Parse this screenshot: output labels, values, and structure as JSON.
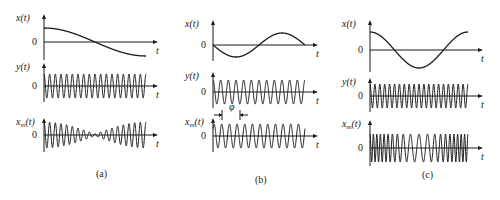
{
  "figure": {
    "colors": {
      "ink": "#1a1a1a",
      "background": "#ffffff"
    },
    "panels": [
      {
        "id": "a",
        "caption": "(a)",
        "caption_pos": [
          96,
          177
        ],
        "axis_x": 44,
        "x_end": 158,
        "wave_end": 146,
        "plots": [
          {
            "name": "x-plot",
            "label": "x(t)",
            "zero_label": "0",
            "t_label": "t",
            "top": 14,
            "zero_y": 42,
            "kind": "cos",
            "amp": 14,
            "cycles": 0.5,
            "start_phase": 0
          },
          {
            "name": "y-plot",
            "label": "y(t)",
            "zero_label": "0",
            "t_label": "t",
            "top": 63,
            "zero_y": 86,
            "kind": "carrier",
            "amp": 12,
            "cycles": 18
          },
          {
            "name": "xm-plot",
            "label": "x_m(t)",
            "zero_label": "0",
            "t_label": "t",
            "top": 118,
            "zero_y": 135,
            "kind": "am",
            "amp": 13,
            "cycles": 18
          }
        ]
      },
      {
        "id": "b",
        "caption": "(b)",
        "caption_pos": [
          255,
          183
        ],
        "axis_x": 213,
        "x_end": 318,
        "wave_end": 305,
        "phase_marker": {
          "label": "φ",
          "x1": 222,
          "x2": 240,
          "y": 115,
          "label_x": 231,
          "label_y": 110
        },
        "plots": [
          {
            "name": "x-plot",
            "label": "x(t)",
            "zero_label": "0",
            "t_label": "t",
            "top": 20,
            "zero_y": 45,
            "kind": "negsin",
            "amp": 12,
            "cycles": 1
          },
          {
            "name": "y-plot",
            "label": "y(t)",
            "zero_label": "0",
            "t_label": "t",
            "top": 72,
            "zero_y": 92,
            "kind": "carrier",
            "amp": 12,
            "cycles": 12
          },
          {
            "name": "xm-plot",
            "label": "x_m(t)",
            "zero_label": "0",
            "t_label": "t",
            "top": 118,
            "zero_y": 136,
            "kind": "pm",
            "amp": 12,
            "cycles": 12
          }
        ]
      },
      {
        "id": "c",
        "caption": "(c)",
        "caption_pos": [
          422,
          178
        ],
        "axis_x": 370,
        "x_end": 483,
        "wave_end": 468,
        "plots": [
          {
            "name": "x-plot",
            "label": "x(t)",
            "zero_label": "0",
            "t_label": "t",
            "top": 20,
            "zero_y": 50,
            "kind": "cos",
            "amp": 18,
            "cycles": 1
          },
          {
            "name": "y-plot",
            "label": "y(t)",
            "zero_label": "0",
            "t_label": "t",
            "top": 78,
            "zero_y": 96,
            "kind": "carrier",
            "amp": 12,
            "cycles": 20
          },
          {
            "name": "xm-plot",
            "label": "x_m(t)",
            "zero_label": "0",
            "t_label": "t",
            "top": 120,
            "zero_y": 148,
            "kind": "fm",
            "amp": 14,
            "cycles": 20
          }
        ]
      }
    ]
  }
}
